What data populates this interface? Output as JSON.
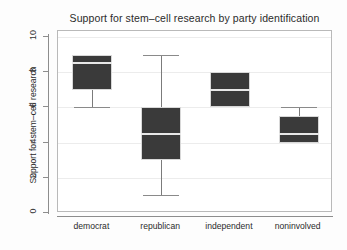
{
  "chart_data": {
    "type": "box",
    "title": "Support for stem–cell research by party identification",
    "xlabel": "",
    "ylabel": "Support for stem–cell research",
    "ylim": [
      0,
      10
    ],
    "yticks": [
      0,
      2,
      4,
      6,
      8,
      10
    ],
    "ytick_labels": [
      "0",
      "2",
      "4",
      "6",
      "8",
      "10"
    ],
    "grid": true,
    "legend": "none",
    "box_fill_color": "#3a3a3a",
    "median_color": "#e8e8e8",
    "categories": [
      "democrat",
      "republican",
      "independent",
      "noninvolved"
    ],
    "boxes": [
      {
        "category": "democrat",
        "q1": 7,
        "median": 8.5,
        "q3": 9,
        "whisker_low": 6,
        "whisker_high": 9
      },
      {
        "category": "republican",
        "q1": 3,
        "median": 4.5,
        "q3": 6,
        "whisker_low": 1,
        "whisker_high": 9
      },
      {
        "category": "independent",
        "q1": 6,
        "median": 7,
        "q3": 8,
        "whisker_low": 6,
        "whisker_high": 8
      },
      {
        "category": "noninvolved",
        "q1": 4,
        "median": 4.5,
        "q3": 5.5,
        "whisker_low": 4,
        "whisker_high": 6
      }
    ]
  }
}
